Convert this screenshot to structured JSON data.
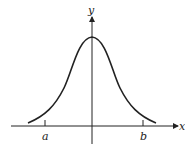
{
  "diagram": {
    "type": "bell-curve",
    "axes": {
      "x_label": "x",
      "y_label": "y"
    },
    "ticks": [
      {
        "label": "a",
        "x": 45
      },
      {
        "label": "b",
        "x": 143
      }
    ],
    "colors": {
      "stroke": "#222222",
      "background": "#ffffff"
    }
  }
}
